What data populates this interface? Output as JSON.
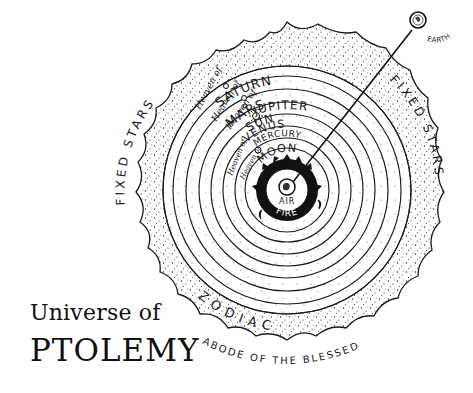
{
  "title": {
    "line1": "Universe of",
    "line2": "PTOLEMY"
  },
  "diagram": {
    "center": [
      287,
      190
    ],
    "spheres": [
      {
        "name": "Earth core",
        "label": "",
        "radius": 13
      },
      {
        "name": "Air",
        "label": "AIR",
        "radius": 22
      },
      {
        "name": "Fire",
        "label": "FIRE",
        "radius": 30
      },
      {
        "name": "Moon",
        "label": "MOON",
        "prefix": "",
        "radius": 42
      },
      {
        "name": "Mercury",
        "label": "MERCURY",
        "prefix": "Heaven of",
        "radius": 52
      },
      {
        "name": "Venus",
        "label": "VENUS",
        "prefix": "Heaven of",
        "radius": 64
      },
      {
        "name": "Sun",
        "label": "SUN",
        "prefix": "",
        "radius": 76
      },
      {
        "name": "Mars",
        "label": "MARS",
        "prefix": "Heaven of",
        "radius": 88
      },
      {
        "name": "Jupiter",
        "label": "JUPITER",
        "prefix": "Heaven of",
        "radius": 101
      },
      {
        "name": "Saturn",
        "label": "SATURN",
        "prefix": "Heaven of",
        "radius": 114
      },
      {
        "name": "Fixed stars inner edge",
        "label": "",
        "radius": 124
      }
    ],
    "outer_band": {
      "labels": [
        "FIXED STARS",
        "FIXED STARS",
        "ZODIAC"
      ],
      "outer_radius": 170
    },
    "earth_marker": {
      "label": "EARTH",
      "position": [
        420,
        12
      ]
    },
    "outside_label": "ABODE OF THE BLESSED",
    "heaven_prefix": "Heaven of",
    "colors": {
      "ink": "#1a1a1a",
      "paper": "#ffffff",
      "fire": "#111111"
    }
  }
}
